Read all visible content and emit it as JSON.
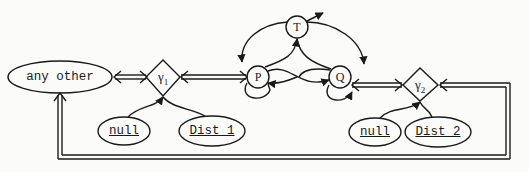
{
  "diagram": {
    "nodes": {
      "any_other": {
        "label": "any other",
        "shape": "ellipse"
      },
      "gamma1": {
        "label": "γ",
        "sub": "1",
        "shape": "diamond"
      },
      "gamma2": {
        "label": "γ",
        "sub": "2",
        "shape": "diamond"
      },
      "P": {
        "label": "P",
        "shape": "circle"
      },
      "Q": {
        "label": "Q",
        "shape": "circle"
      },
      "T": {
        "label": "T",
        "shape": "circle"
      },
      "null1": {
        "label": "null",
        "shape": "ellipse",
        "underlined": true
      },
      "dist1": {
        "label": "Dist 1",
        "shape": "ellipse",
        "underlined": true
      },
      "null2": {
        "label": "null",
        "shape": "ellipse",
        "underlined": true
      },
      "dist2": {
        "label": "Dist 2",
        "shape": "ellipse",
        "underlined": true
      }
    },
    "edges": [
      {
        "from": "any_other",
        "to": "gamma1",
        "type": "double-bidirectional"
      },
      {
        "from": "gamma1",
        "to": "P",
        "type": "double-bidirectional"
      },
      {
        "from": "Q",
        "to": "gamma2",
        "type": "double-bidirectional"
      },
      {
        "from": "gamma2",
        "to": "any_other",
        "type": "double-loop-return"
      },
      {
        "from": "null1",
        "to": "gamma1",
        "type": "curve"
      },
      {
        "from": "dist1",
        "to": "gamma1",
        "type": "curve"
      },
      {
        "from": "null2",
        "to": "gamma2",
        "type": "curve"
      },
      {
        "from": "dist2",
        "to": "gamma2",
        "type": "curve"
      },
      {
        "from": "P",
        "to": "T",
        "type": "curve"
      },
      {
        "from": "Q",
        "to": "T",
        "type": "curve"
      },
      {
        "from": "T",
        "to": "P",
        "type": "curve"
      },
      {
        "from": "T",
        "to": "Q",
        "type": "curve"
      },
      {
        "from": "T",
        "to": "out",
        "type": "arrow"
      },
      {
        "from": "P",
        "to": "Q",
        "type": "curve"
      },
      {
        "from": "Q",
        "to": "P",
        "type": "curve"
      },
      {
        "from": "P",
        "to": "P",
        "type": "self-loop"
      },
      {
        "from": "Q",
        "to": "Q",
        "type": "self-loop"
      }
    ]
  }
}
